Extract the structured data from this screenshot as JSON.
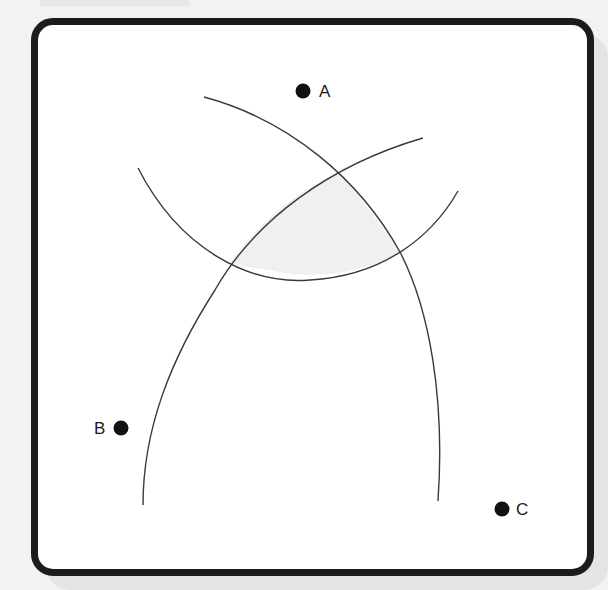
{
  "diagram": {
    "type": "locus-intersection",
    "points": [
      {
        "label": "A",
        "x": 303,
        "y": 91
      },
      {
        "label": "B",
        "x": 121,
        "y": 428
      },
      {
        "label": "C",
        "x": 502,
        "y": 509
      }
    ],
    "labels": {
      "a": "A",
      "b": "B",
      "c": "C"
    },
    "arcs": 3,
    "shaded_region": "intersection of three arcs",
    "colors": {
      "frame": "#1c1c1c",
      "arc": "#3a3a3a",
      "shade": "#f0f0f0",
      "point": "#111111"
    }
  }
}
